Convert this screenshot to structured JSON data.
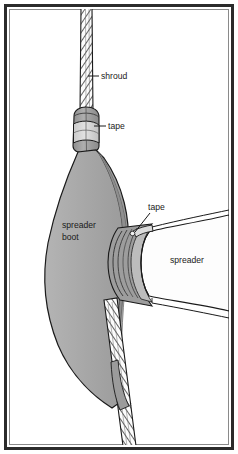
{
  "figure": {
    "name": "spreader-boot-rigging-diagram",
    "type": "technical-line-illustration",
    "background_color": "#ffffff",
    "frame": {
      "border_color": "#2b2b2b",
      "inner_border_color": "#6e6e6e",
      "fill_color": "#ffffff"
    },
    "palette": {
      "outline": "#1a1a1a",
      "boot_fill": "#a9a9a9",
      "boot_fill_dark": "#8e8e8e",
      "boot_fill_light": "#bdbdbd",
      "collar_fill": "#9a9a9a",
      "tape_fill": "#d2d2d2",
      "spreader_fill": "#fdfdfd",
      "rope_fill": "#fbfbfb",
      "rope_strand": "#3a3a3a",
      "socket_ring": "#c2c2c2"
    },
    "labels": [
      {
        "id": "shroud",
        "text": "shroud",
        "x": 101,
        "y": 79,
        "anchor": "start",
        "leader": {
          "x1": 99,
          "y1": 76,
          "x2": 88,
          "y2": 76
        }
      },
      {
        "id": "tape-upper",
        "text": "tape",
        "x": 108,
        "y": 129,
        "anchor": "start",
        "leader": {
          "x1": 106,
          "y1": 126,
          "x2": 94,
          "y2": 126
        }
      },
      {
        "id": "tape-lower",
        "text": "tape",
        "x": 148,
        "y": 210,
        "anchor": "start",
        "leader": {
          "x1": 150,
          "y1": 213,
          "x2": 137,
          "y2": 231
        }
      },
      {
        "id": "spreader-boot",
        "text_line_1": "spreader",
        "text_line_2": "boot",
        "x": 62,
        "y": 228,
        "anchor": "start"
      },
      {
        "id": "spreader",
        "text": "spreader",
        "x": 170,
        "y": 263,
        "anchor": "start"
      }
    ],
    "parts": [
      {
        "id": "shroud-upper",
        "description": "wire rope shroud entering from top"
      },
      {
        "id": "shroud-lower",
        "description": "wire rope shroud exiting at bottom"
      },
      {
        "id": "collar",
        "description": "dark collar at top of boot"
      },
      {
        "id": "tape-wrap-upper",
        "description": "tape band wrapped around upper collar"
      },
      {
        "id": "boot-body",
        "description": "gray flared spreader boot cone"
      },
      {
        "id": "socket",
        "description": "concentric ring socket where spreader enters boot"
      },
      {
        "id": "spreader-arm",
        "description": "spreader arm tapering out to the right"
      },
      {
        "id": "tape-wrap-lower",
        "description": "tape at spreader tip inside boot"
      }
    ]
  }
}
